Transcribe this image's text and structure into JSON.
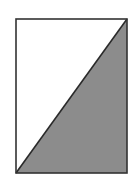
{
  "diagram": {
    "rectangle": {
      "x": 16,
      "y": 19,
      "width": 111,
      "height": 154
    },
    "diagonal": {
      "from": "bottom-left",
      "to": "top-right"
    },
    "shaded_region": "lower-right-triangle",
    "colors": {
      "background": "#ffffff",
      "outline": "#333333",
      "fill_shaded": "#8c8c8c",
      "fill_unshaded": "#ffffff"
    }
  }
}
